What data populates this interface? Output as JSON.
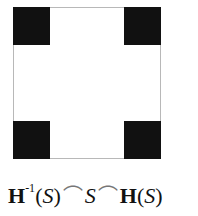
{
  "diagram": {
    "formula": {
      "H": "H",
      "inv": "-1",
      "lp": "(",
      "S": "S",
      "rp": ")",
      "cap": "⌒"
    }
  }
}
